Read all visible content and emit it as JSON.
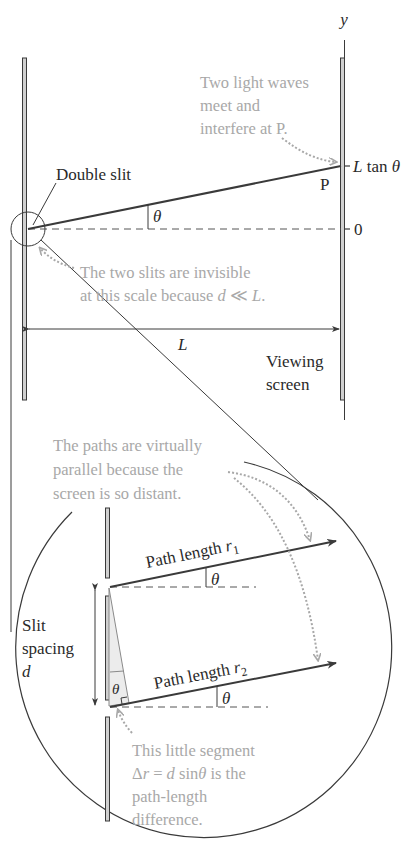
{
  "figure": {
    "top": {
      "axis_label": "y",
      "double_slit_label": "Double slit",
      "theta": "θ",
      "point_label": "P",
      "tick_top": "L tan θ",
      "tick_top_L": "L",
      "tick_top_tan": " tan ",
      "tick_zero": "0",
      "distance_label": "L",
      "screen_label_line1": "Viewing",
      "screen_label_line2": "screen",
      "note_waves": [
        "Two light waves",
        "meet and",
        "interfere at P."
      ],
      "note_invisible_line1": "The two slits are invisible",
      "note_invisible_line2_prefix": "at this scale because ",
      "note_invisible_d": "d",
      "note_invisible_ll": " ≪ ",
      "note_invisible_L": "L",
      "note_invisible_end": "."
    },
    "zoom": {
      "note_parallel": [
        "The paths are virtually",
        "parallel because the",
        "screen is so distant."
      ],
      "path1_label": "Path length ",
      "path1_var": "r",
      "path1_sub": "1",
      "path2_label": "Path length ",
      "path2_var": "r",
      "path2_sub": "2",
      "theta": "θ",
      "slit_spacing_line1": "Slit",
      "slit_spacing_line2": "spacing",
      "slit_spacing_var": "d",
      "note_segment_line1": "This little segment",
      "note_segment_delta": "Δ",
      "note_segment_r": "r",
      "note_segment_eq": " = ",
      "note_segment_d": "d",
      "note_segment_sin": " sin",
      "note_segment_rest": " is the",
      "note_segment_line3": "path-length",
      "note_segment_line4": "difference."
    },
    "colors": {
      "line": "#3a3a3a",
      "annotation": "#a8a8a8",
      "barrier_fill": "#d0d0d0",
      "triangle_fill": "#ececec"
    }
  }
}
